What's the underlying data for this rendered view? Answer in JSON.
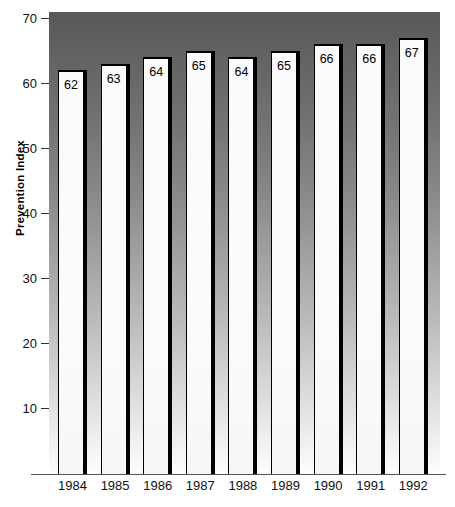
{
  "chart_data": {
    "type": "bar",
    "title": "",
    "subtitle": "",
    "xlabel": "",
    "ylabel": "Prevention Index",
    "categories": [
      "1984",
      "1985",
      "1986",
      "1987",
      "1988",
      "1989",
      "1990",
      "1991",
      "1992"
    ],
    "values": [
      62,
      63,
      64,
      65,
      64,
      65,
      66,
      66,
      67
    ],
    "data_labels": [
      "62",
      "63",
      "64",
      "65",
      "64",
      "65",
      "66",
      "66",
      "67"
    ],
    "ylim": [
      0,
      72
    ],
    "y_ticks": [
      10,
      20,
      30,
      40,
      50,
      60,
      70
    ],
    "y_tick_labels": [
      "10",
      "20",
      "30",
      "40",
      "50",
      "60",
      "70"
    ],
    "grid": false,
    "legend": null,
    "legend_position": "none",
    "annotations": [],
    "style": {
      "plot_background_top_color": "#585858",
      "plot_background_bottom_color": "#fdfdfd",
      "bar_fill_color": "#fbfbfb",
      "bar_outline_color": "#000000",
      "axis_color": "#555555",
      "text_color": "#111111"
    }
  }
}
